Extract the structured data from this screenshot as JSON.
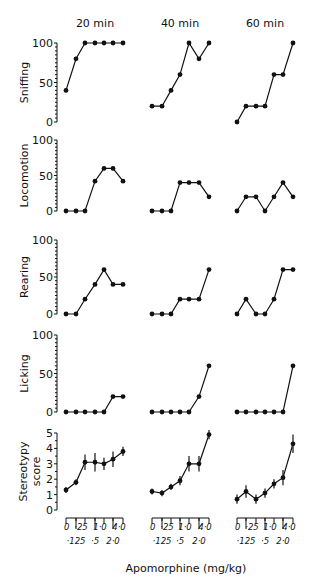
{
  "figure": {
    "x_axis_label": "Apomorphine (mg/kg)",
    "column_titles": [
      "20 min",
      "40 min",
      "60 min"
    ]
  },
  "chart_data": {
    "type": "line",
    "layout": "small multiples, 5 rows (behaviours) x 3 columns (time after injection)",
    "xlabel": "Apomorphine (mg/kg)",
    "x_categories": [
      "0",
      "·125",
      "·25",
      "·5",
      "1·0",
      "2·0",
      "4·0"
    ],
    "x_tick_labels_upper": [
      "0",
      "·25",
      "1·0",
      "4·0"
    ],
    "x_tick_labels_lower": [
      "·125",
      "·5",
      "2·0"
    ],
    "columns": [
      "20 min",
      "40 min",
      "60 min"
    ],
    "grid": false,
    "legend": "none",
    "panels": [
      {
        "ylabel": "Sniffing",
        "ylim": [
          0,
          100
        ],
        "yticks": [
          "0",
          "50",
          "100"
        ],
        "series": [
          {
            "name": "20 min",
            "values": [
              40,
              80,
              100,
              100,
              100,
              100,
              100
            ]
          },
          {
            "name": "40 min",
            "values": [
              20,
              20,
              40,
              60,
              100,
              80,
              100
            ]
          },
          {
            "name": "60 min",
            "values": [
              0,
              20,
              20,
              20,
              60,
              60,
              100
            ]
          }
        ]
      },
      {
        "ylabel": "Locomotion",
        "ylim": [
          0,
          100
        ],
        "yticks": [
          "0",
          "50",
          "100"
        ],
        "series": [
          {
            "name": "20 min",
            "values": [
              0,
              0,
              0,
              42,
              60,
              60,
              42
            ]
          },
          {
            "name": "40 min",
            "values": [
              0,
              0,
              0,
              40,
              40,
              40,
              20
            ]
          },
          {
            "name": "60 min",
            "values": [
              0,
              20,
              20,
              0,
              20,
              40,
              20
            ]
          }
        ]
      },
      {
        "ylabel": "Rearing",
        "ylim": [
          0,
          100
        ],
        "yticks": [
          "0",
          "50",
          "100"
        ],
        "series": [
          {
            "name": "20 min",
            "values": [
              0,
              0,
              20,
              40,
              60,
              40,
              40
            ]
          },
          {
            "name": "40 min",
            "values": [
              0,
              0,
              0,
              20,
              20,
              20,
              60
            ]
          },
          {
            "name": "60 min",
            "values": [
              0,
              20,
              0,
              0,
              20,
              60,
              60
            ]
          }
        ]
      },
      {
        "ylabel": "Licking",
        "ylim": [
          0,
          100
        ],
        "yticks": [
          "0",
          "50",
          "100"
        ],
        "series": [
          {
            "name": "20 min",
            "values": [
              0,
              0,
              0,
              0,
              0,
              20,
              20
            ]
          },
          {
            "name": "40 min",
            "values": [
              0,
              0,
              0,
              0,
              0,
              20,
              60
            ]
          },
          {
            "name": "60 min",
            "values": [
              0,
              0,
              0,
              0,
              0,
              0,
              60
            ]
          }
        ]
      },
      {
        "ylabel": "Stereotypy score",
        "ylim": [
          0,
          5
        ],
        "yticks": [
          "0",
          "1",
          "2",
          "3",
          "4",
          "5"
        ],
        "error_bars": true,
        "series": [
          {
            "name": "20 min",
            "values": [
              1.3,
              1.8,
              3.1,
              3.1,
              3.0,
              3.3,
              3.8
            ],
            "err": [
              0.2,
              0.2,
              0.5,
              0.6,
              0.4,
              0.5,
              0.3
            ]
          },
          {
            "name": "40 min",
            "values": [
              1.2,
              1.1,
              1.5,
              1.9,
              3.0,
              3.0,
              4.9
            ],
            "err": [
              0.2,
              0.2,
              0.2,
              0.3,
              0.5,
              0.5,
              0.3
            ]
          },
          {
            "name": "60 min",
            "values": [
              0.7,
              1.2,
              0.7,
              1.1,
              1.7,
              2.1,
              4.3
            ],
            "err": [
              0.3,
              0.4,
              0.3,
              0.3,
              0.3,
              0.5,
              0.6
            ]
          }
        ]
      }
    ]
  }
}
